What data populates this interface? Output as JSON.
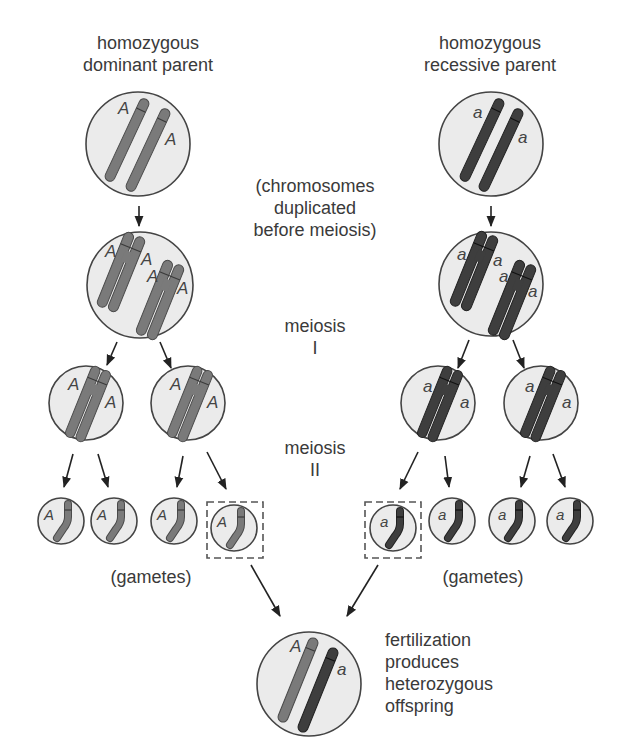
{
  "diagram": {
    "title_left": [
      "homozygous",
      "dominant parent"
    ],
    "title_right": [
      "homozygous",
      "recessive parent"
    ],
    "center_labels": {
      "duplication": [
        "(chromosomes",
        "duplicated",
        "before meiosis)"
      ],
      "meiosis_1": [
        "meiosis",
        "I"
      ],
      "meiosis_2": [
        "meiosis",
        "II"
      ]
    },
    "gametes_left_label": "(gametes)",
    "gametes_right_label": "(gametes)",
    "offspring_label": [
      "fertilization",
      "produces",
      "heterozygous",
      "offspring"
    ],
    "alleles": {
      "dominant": "A",
      "recessive": "a"
    },
    "colors": {
      "cell_fill": "#ebebeb",
      "cell_stroke": "#444444",
      "dominant_chromosome": "#7a7a7a",
      "recessive_chromosome": "#3e3e3e",
      "arrow": "#222222",
      "selection_box": "#555555"
    },
    "nodes": [
      {
        "id": "parent-dominant",
        "stage": "parent",
        "genotype": "AA"
      },
      {
        "id": "parent-recessive",
        "stage": "parent",
        "genotype": "aa"
      },
      {
        "id": "dup-dominant",
        "stage": "duplicated",
        "genotype": "AA"
      },
      {
        "id": "dup-recessive",
        "stage": "duplicated",
        "genotype": "aa"
      },
      {
        "id": "meiosis1-dominant-1",
        "stage": "meiosis I",
        "genotype": "A"
      },
      {
        "id": "meiosis1-dominant-2",
        "stage": "meiosis I",
        "genotype": "A"
      },
      {
        "id": "meiosis1-recessive-1",
        "stage": "meiosis I",
        "genotype": "a"
      },
      {
        "id": "meiosis1-recessive-2",
        "stage": "meiosis I",
        "genotype": "a"
      },
      {
        "id": "gametes-dominant",
        "stage": "gamete",
        "count": 4,
        "genotype": "A",
        "selected_index": 3
      },
      {
        "id": "gametes-recessive",
        "stage": "gamete",
        "count": 4,
        "genotype": "a",
        "selected_index": 0
      },
      {
        "id": "offspring",
        "stage": "fertilization",
        "genotype": "Aa"
      }
    ]
  }
}
